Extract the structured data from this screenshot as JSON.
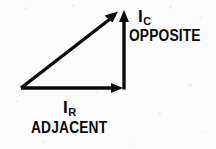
{
  "figure": {
    "background_color": "#fdfdfd",
    "stroke_color": "#0a0a0a",
    "stroke_width": 3
  },
  "labels": {
    "capacitive_current": {
      "symbol": "I",
      "subscript": "C"
    },
    "capacitive_side": "OPPOSITE",
    "resistive_current": {
      "symbol": "I",
      "subscript": "R"
    },
    "resistive_side": "ADJACENT"
  },
  "diagram": {
    "vertices": {
      "origin": [
        21,
        88
      ],
      "corner": [
        122,
        88
      ],
      "apex": [
        117,
        13
      ]
    },
    "vectors": [
      {
        "name": "resistive-current-vector",
        "label": "I_R",
        "from": [
          21,
          88
        ],
        "to": [
          122,
          88
        ],
        "direction": "right",
        "role": "adjacent"
      },
      {
        "name": "capacitive-current-vector",
        "label": "I_C",
        "from": [
          124,
          88
        ],
        "to": [
          124,
          13
        ],
        "direction": "up",
        "role": "opposite"
      },
      {
        "name": "total-current-vector",
        "label": "",
        "from": [
          21,
          88
        ],
        "to": [
          117,
          13
        ],
        "direction": "up-right",
        "role": "hypotenuse"
      }
    ]
  }
}
